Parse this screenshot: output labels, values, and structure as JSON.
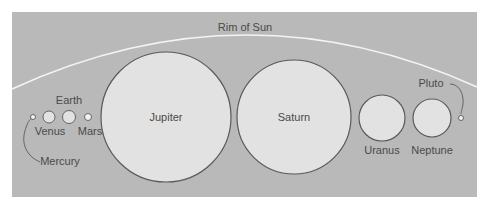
{
  "figure": {
    "title": "Rim of Sun",
    "colors": {
      "background": "#ffffff",
      "panel": "#b9b9b9",
      "planet_fill": "#e2e2e2",
      "planet_stroke": "#5a5a5a",
      "label": "#4a4a4a",
      "sun_rim": "#f4f4f4"
    },
    "panel": {
      "x": 12,
      "y": 12,
      "width": 465,
      "height": 185
    },
    "sun_rim": {
      "label": "Rim of Sun",
      "label_pos": {
        "x": 245,
        "y": 31
      },
      "path": "M12,89 Q245,-18 477,87"
    },
    "planets": [
      {
        "name": "Mercury",
        "label": "Mercury",
        "cx": 33,
        "cy": 117,
        "r": 2.5,
        "label_x": 60,
        "label_y": 165,
        "label_anchor": "middle"
      },
      {
        "name": "Venus",
        "label": "Venus",
        "cx": 49,
        "cy": 117,
        "r": 6,
        "label_x": 50,
        "label_y": 135,
        "label_anchor": "middle"
      },
      {
        "name": "Earth",
        "label": "Earth",
        "cx": 69,
        "cy": 117,
        "r": 6.5,
        "label_x": 69,
        "label_y": 104,
        "label_anchor": "middle"
      },
      {
        "name": "Mars",
        "label": "Mars",
        "cx": 88,
        "cy": 117,
        "r": 3.5,
        "label_x": 90,
        "label_y": 135,
        "label_anchor": "middle"
      },
      {
        "name": "Jupiter",
        "label": "Jupiter",
        "cx": 166,
        "cy": 117,
        "r": 65,
        "label_x": 166,
        "label_y": 121,
        "label_anchor": "middle"
      },
      {
        "name": "Saturn",
        "label": "Saturn",
        "cx": 294,
        "cy": 117,
        "r": 57,
        "label_x": 294,
        "label_y": 121,
        "label_anchor": "middle"
      },
      {
        "name": "Uranus",
        "label": "Uranus",
        "cx": 382,
        "cy": 118,
        "r": 23,
        "label_x": 382,
        "label_y": 154,
        "label_anchor": "middle"
      },
      {
        "name": "Neptune",
        "label": "Neptune",
        "cx": 432,
        "cy": 118,
        "r": 19,
        "label_x": 432,
        "label_y": 154,
        "label_anchor": "middle"
      },
      {
        "name": "Pluto",
        "label": "Pluto",
        "cx": 461,
        "cy": 118,
        "r": 2.5,
        "label_x": 431,
        "label_y": 87,
        "label_anchor": "middle"
      }
    ],
    "leaders": [
      {
        "for": "Mercury",
        "path": "M40,162 C30,158 22,148 24,135 C26,125 29,120 31,119"
      },
      {
        "for": "Pluto",
        "path": "M450,84 C458,84 464,92 463,104 C462,110 461,112 461,114"
      }
    ]
  }
}
